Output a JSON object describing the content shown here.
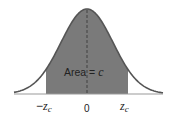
{
  "figure": {
    "type": "normal-distribution-diagram",
    "area_label_prefix": "Area = ",
    "area_label_var": "c",
    "ticks": [
      {
        "label_sign": "−",
        "label_var": "z",
        "label_sub": "c"
      },
      {
        "label": "0"
      },
      {
        "label_sign": "",
        "label_var": "z",
        "label_sub": "c"
      }
    ],
    "colors": {
      "fill": "#7a7a7a",
      "curve": "#555555",
      "axis": "#9a9a9a",
      "centerline": "#3a3a3a",
      "text": "#222222"
    }
  }
}
